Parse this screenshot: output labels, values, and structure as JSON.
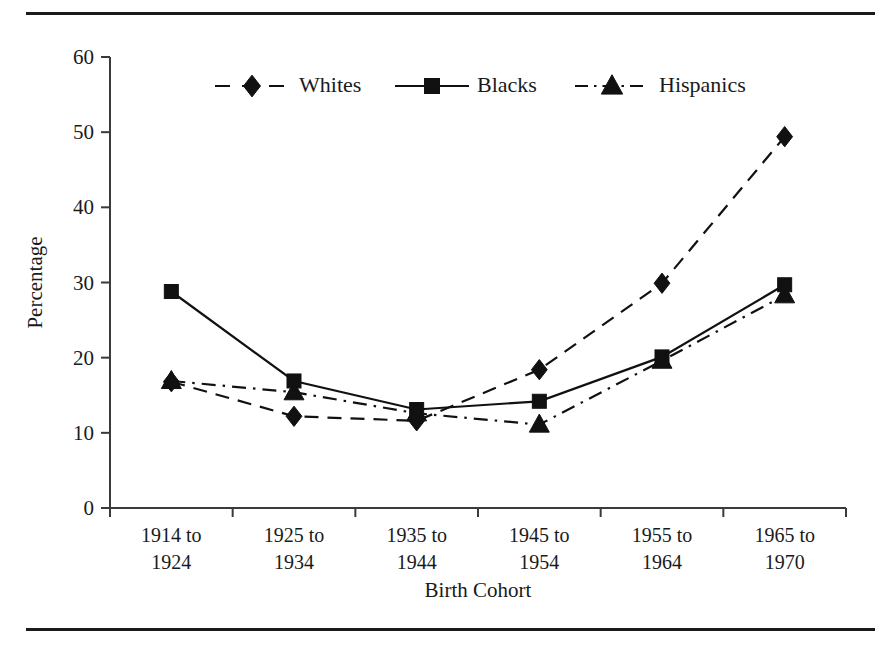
{
  "figure": {
    "has_top_rule": true,
    "has_bottom_rule": true,
    "background_color": "#ffffff",
    "ink_color": "#111111"
  },
  "chart_data": {
    "type": "line",
    "title": "",
    "xlabel": "Birth Cohort",
    "ylabel": "Percentage",
    "categories": [
      "1914 to\n1924",
      "1925 to\n1934",
      "1935 to\n1944",
      "1945 to\n1954",
      "1955 to\n1964",
      "1965 to\n1970"
    ],
    "category_lines": [
      [
        "1914 to",
        "1924"
      ],
      [
        "1925 to",
        "1934"
      ],
      [
        "1935 to",
        "1944"
      ],
      [
        "1945 to",
        "1954"
      ],
      [
        "1955 to",
        "1964"
      ],
      [
        "1965 to",
        "1970"
      ]
    ],
    "ylim": [
      0,
      60
    ],
    "yticks": [
      0,
      10,
      20,
      30,
      40,
      50,
      60
    ],
    "ytick_labels": [
      "0",
      "10",
      "20",
      "30",
      "40",
      "50",
      "60"
    ],
    "grid": false,
    "legend_position": "top-center-inside",
    "series": [
      {
        "name": "Whites",
        "marker": "diamond",
        "line_style": "dashed",
        "values": [
          16.8,
          12.2,
          11.6,
          18.4,
          29.9,
          49.4
        ]
      },
      {
        "name": "Blacks",
        "marker": "square",
        "line_style": "solid",
        "values": [
          28.8,
          16.9,
          13.1,
          14.2,
          20.1,
          29.7
        ]
      },
      {
        "name": "Hispanics",
        "marker": "triangle",
        "line_style": "dashdot",
        "values": [
          16.9,
          15.4,
          12.6,
          11.1,
          19.6,
          28.3
        ]
      }
    ]
  },
  "legend": {
    "entries": [
      {
        "label": "Whites",
        "marker": "diamond",
        "line_style": "dashed"
      },
      {
        "label": "Blacks",
        "marker": "square",
        "line_style": "solid"
      },
      {
        "label": "Hispanics",
        "marker": "triangle",
        "line_style": "dashdot"
      }
    ]
  }
}
